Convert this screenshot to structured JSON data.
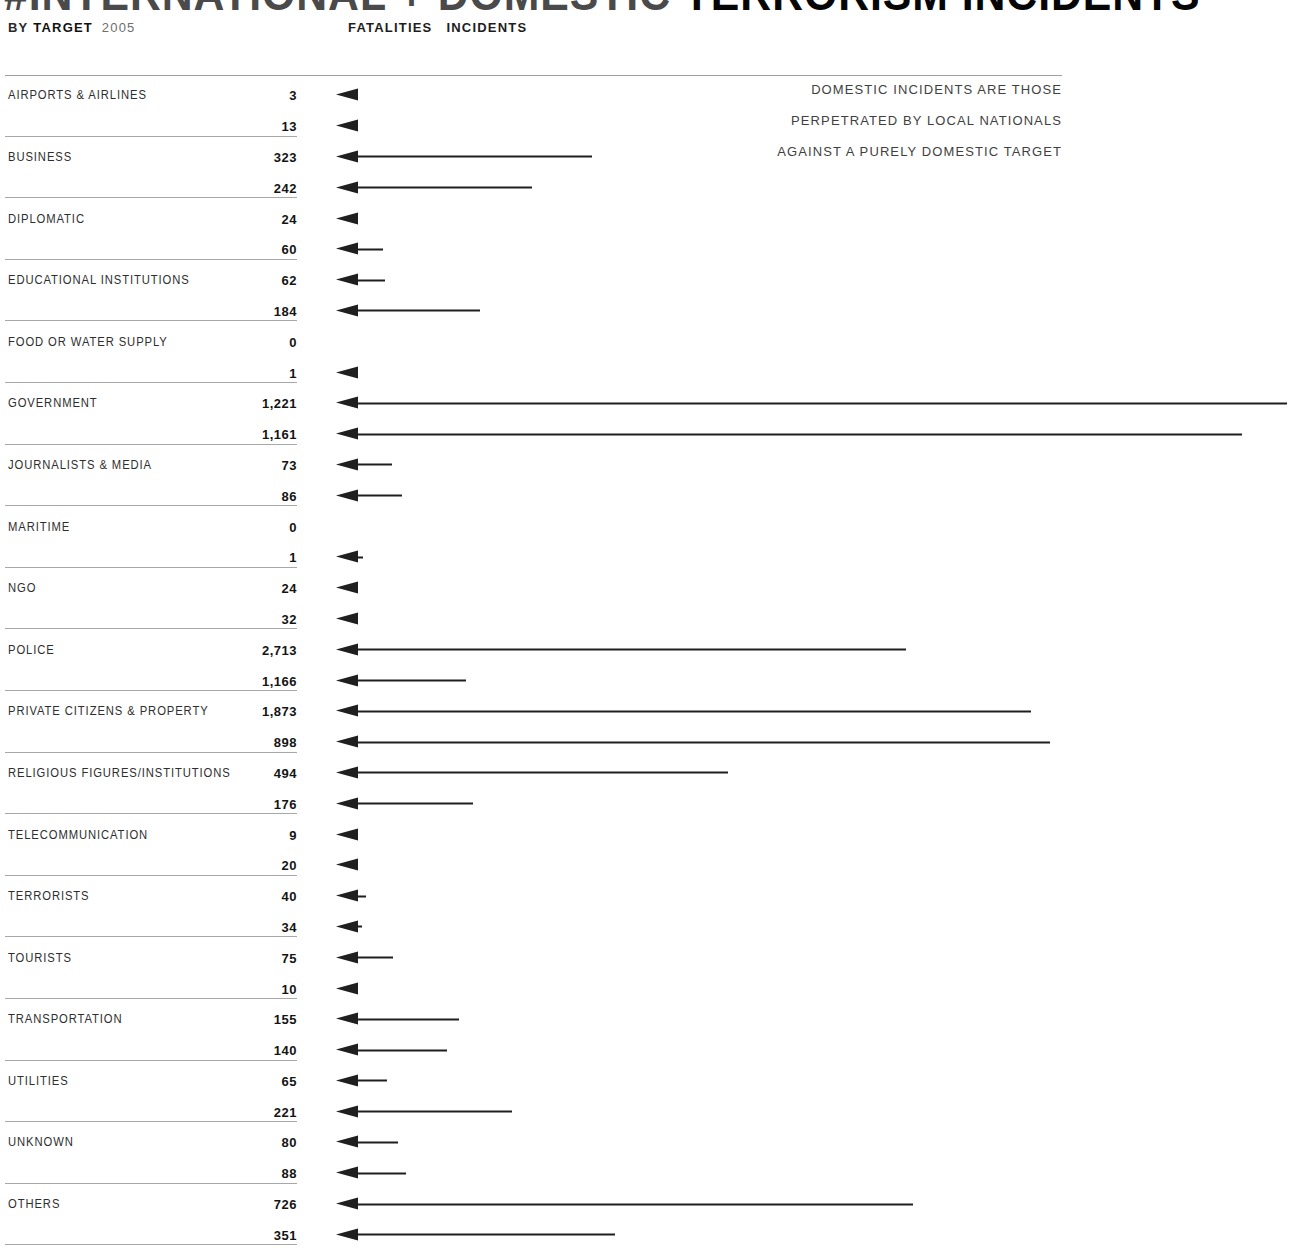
{
  "title": {
    "light": "#INTERNATIONAL + DOMESTIC",
    "bold": "TERRORISM INCIDENTS"
  },
  "subtitle": {
    "by": "BY",
    "target_word": "TARGET",
    "year": "2005"
  },
  "headers": {
    "fatalities": "FATALITIES",
    "incidents": "INCIDENTS"
  },
  "annotation": [
    "DOMESTIC INCIDENTS ARE THOSE",
    "PERPETRATED BY LOCAL NATIONALS",
    "AGAINST A PURELY DOMESTIC TARGET"
  ],
  "colors": {
    "background": "#ffffff",
    "ink": "#1f1f1f",
    "label_text": "#2e2e2e",
    "muted_text": "#3f3f3f",
    "rule": "#a8a8a8"
  },
  "chart_data": {
    "type": "bar",
    "orientation": "horizontal; left-pointing arrows, length encodes value",
    "title": "#INTERNATIONAL + DOMESTIC TERRORISM INCIDENTS",
    "subtitle": "BY TARGET 2005",
    "legend_position": "top",
    "grid": "off",
    "annotation": "DOMESTIC INCIDENTS ARE THOSE PERPETRATED BY LOCAL NATIONALS AGAINST A PURELY DOMESTIC TARGET",
    "categories": [
      "AIRPORTS & AIRLINES",
      "BUSINESS",
      "DIPLOMATIC",
      "EDUCATIONAL INSTITUTIONS",
      "FOOD OR WATER SUPPLY",
      "GOVERNMENT",
      "JOURNALISTS & MEDIA",
      "MARITIME",
      "NGO",
      "POLICE",
      "PRIVATE CITIZENS & PROPERTY",
      "RELIGIOUS FIGURES/INSTITUTIONS",
      "TELECOMMUNICATION",
      "TERRORISTS",
      "TOURISTS",
      "TRANSPORTATION",
      "UTILITIES",
      "UNKNOWN",
      "OTHERS"
    ],
    "series": [
      {
        "name": "FATALITIES",
        "values": [
          3,
          323,
          24,
          62,
          0,
          1221,
          73,
          0,
          24,
          2713,
          1873,
          494,
          9,
          40,
          75,
          155,
          65,
          80,
          726
        ]
      },
      {
        "name": "INCIDENTS",
        "values": [
          13,
          242,
          60,
          184,
          1,
          1161,
          86,
          1,
          32,
          1166,
          898,
          176,
          20,
          34,
          10,
          140,
          221,
          88,
          351
        ]
      }
    ],
    "arrow_lengths_px": {
      "fatalities": [
        20,
        256,
        22,
        49,
        0,
        951,
        56,
        0,
        20,
        570,
        695,
        392,
        20,
        30,
        57,
        123,
        51,
        62,
        577
      ],
      "incidents": [
        20,
        196,
        47,
        144,
        18,
        906,
        66,
        27,
        23,
        130,
        714,
        137,
        22,
        26,
        20,
        111,
        176,
        70,
        279
      ]
    }
  }
}
